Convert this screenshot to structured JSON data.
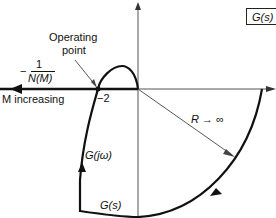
{
  "diagram": {
    "title_box": "G(s)",
    "operating_point_label": [
      "Operating",
      "point"
    ],
    "describing_function": {
      "sign": "−",
      "numerator": "1",
      "denominator": "N(M)"
    },
    "m_increasing_label": "M increasing",
    "crossing_value": "−2",
    "radius_label": "R → ∞",
    "g_jw_label": "G(jω)",
    "g_s_bottom_label": "G(s)",
    "colors": {
      "curve": "#111111",
      "axis": "#555555",
      "background": "#ffffff"
    }
  }
}
